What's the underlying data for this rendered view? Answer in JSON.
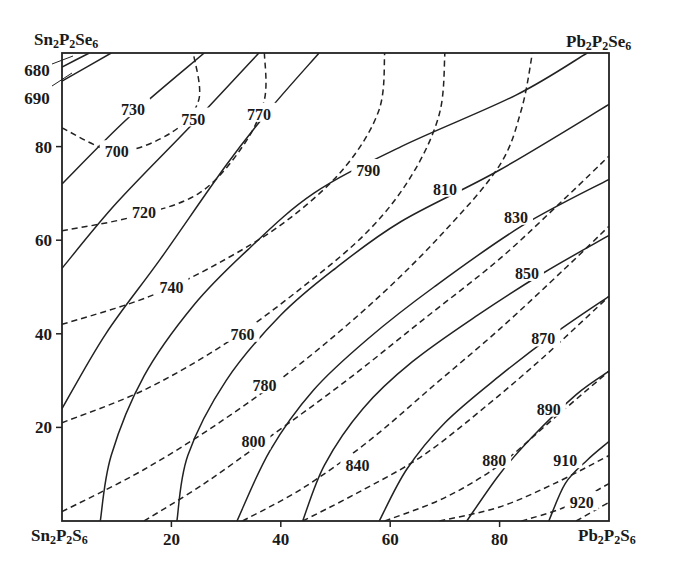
{
  "chart_data": {
    "type": "contour",
    "title": "",
    "corners": {
      "top_left": "Sn2P2Se6",
      "top_right": "Pb2P2Se6",
      "bottom_left": "Sn2P2S6",
      "bottom_right": "Pb2P2S6"
    },
    "corner_labels": {
      "top_left": {
        "base1": "Sn",
        "s1": "2",
        "base2": "P",
        "s2": "2",
        "base3": "Se",
        "s3": "6"
      },
      "top_right": {
        "base1": "Pb",
        "s1": "2",
        "base2": "P",
        "s2": "2",
        "base3": "Se",
        "s3": "6"
      },
      "bottom_left": {
        "base1": "Sn",
        "s1": "2",
        "base2": "P",
        "s2": "2",
        "base3": "S",
        "s3": "6"
      },
      "bottom_right": {
        "base1": "Pb",
        "s1": "2",
        "base2": "P",
        "s2": "2",
        "base3": "S",
        "s3": "6"
      }
    },
    "xlabel": "",
    "ylabel": "",
    "xlim": [
      0,
      100
    ],
    "ylim": [
      0,
      100
    ],
    "x_ticks": [
      "20",
      "40",
      "60",
      "80"
    ],
    "y_ticks": [
      "20",
      "40",
      "60",
      "80"
    ],
    "grid": false,
    "solid_isotherms": [
      {
        "value": 680,
        "label": "680",
        "points": [
          [
            0,
            97
          ],
          [
            5,
            100
          ]
        ]
      },
      {
        "value": 690,
        "label": "690",
        "points": [
          [
            0,
            94
          ],
          [
            9,
            100
          ]
        ]
      },
      {
        "value": 730,
        "label": "730",
        "points": [
          [
            0,
            72
          ],
          [
            12,
            86
          ],
          [
            26,
            100
          ]
        ]
      },
      {
        "value": 750,
        "label": "750",
        "points": [
          [
            0,
            54
          ],
          [
            10,
            68
          ],
          [
            24,
            85
          ],
          [
            36,
            100
          ]
        ]
      },
      {
        "value": 770,
        "label": "770",
        "points": [
          [
            0,
            24
          ],
          [
            8,
            40
          ],
          [
            18,
            56
          ],
          [
            30,
            76
          ],
          [
            38,
            88
          ],
          [
            47,
            100
          ]
        ]
      },
      {
        "value": 790,
        "label": "790",
        "points": [
          [
            7,
            0
          ],
          [
            9,
            14
          ],
          [
            15,
            31
          ],
          [
            24,
            46
          ],
          [
            34,
            58
          ],
          [
            46,
            70
          ],
          [
            62,
            80
          ],
          [
            83,
            91
          ],
          [
            96,
            100
          ]
        ]
      },
      {
        "value": 810,
        "label": "810",
        "points": [
          [
            21,
            0
          ],
          [
            23,
            14
          ],
          [
            30,
            30
          ],
          [
            40,
            44
          ],
          [
            50,
            54
          ],
          [
            62,
            64
          ],
          [
            80,
            75
          ],
          [
            100,
            89
          ]
        ]
      },
      {
        "value": 830,
        "label": "830",
        "points": [
          [
            32,
            0
          ],
          [
            38,
            15
          ],
          [
            46,
            28
          ],
          [
            56,
            39
          ],
          [
            68,
            50
          ],
          [
            84,
            63
          ],
          [
            100,
            73
          ]
        ]
      },
      {
        "value": 850,
        "label": "850",
        "points": [
          [
            44,
            0
          ],
          [
            48,
            12
          ],
          [
            55,
            24
          ],
          [
            64,
            34
          ],
          [
            76,
            44
          ],
          [
            88,
            53
          ],
          [
            100,
            61
          ]
        ]
      },
      {
        "value": 870,
        "label": "870",
        "points": [
          [
            58,
            0
          ],
          [
            63,
            11
          ],
          [
            70,
            21
          ],
          [
            80,
            31
          ],
          [
            90,
            40
          ],
          [
            100,
            48
          ]
        ]
      },
      {
        "value": 890,
        "label": "890",
        "points": [
          [
            74,
            0
          ],
          [
            80,
            10
          ],
          [
            86,
            18
          ],
          [
            94,
            27
          ],
          [
            100,
            32
          ]
        ]
      },
      {
        "value": 910,
        "label": "910",
        "points": [
          [
            89,
            0
          ],
          [
            92,
            8
          ],
          [
            96,
            13
          ],
          [
            100,
            17
          ]
        ]
      }
    ],
    "dashed_isotherms": [
      {
        "value": 700,
        "label": "700",
        "points": [
          [
            0,
            84
          ],
          [
            10,
            79
          ],
          [
            20,
            83
          ],
          [
            25,
            90
          ],
          [
            24,
            100
          ]
        ]
      },
      {
        "value": 720,
        "label": "720",
        "points": [
          [
            0,
            62
          ],
          [
            13,
            65
          ],
          [
            25,
            70
          ],
          [
            33,
            80
          ],
          [
            37,
            90
          ],
          [
            37,
            100
          ]
        ]
      },
      {
        "value": 740,
        "label": "740",
        "points": [
          [
            0,
            42
          ],
          [
            16,
            48
          ],
          [
            30,
            56
          ],
          [
            42,
            65
          ],
          [
            52,
            76
          ],
          [
            58,
            88
          ],
          [
            59,
            100
          ]
        ]
      },
      {
        "value": 760,
        "label": "760",
        "points": [
          [
            0,
            21
          ],
          [
            15,
            28
          ],
          [
            30,
            38
          ],
          [
            44,
            50
          ],
          [
            56,
            62
          ],
          [
            64,
            74
          ],
          [
            69,
            87
          ],
          [
            70,
            100
          ]
        ]
      },
      {
        "value": 780,
        "label": "780",
        "points": [
          [
            0,
            2
          ],
          [
            15,
            11
          ],
          [
            30,
            22
          ],
          [
            44,
            34
          ],
          [
            58,
            48
          ],
          [
            70,
            62
          ],
          [
            80,
            76
          ],
          [
            84,
            88
          ],
          [
            86,
            100
          ]
        ]
      },
      {
        "value": 800,
        "label": "800",
        "points": [
          [
            15,
            0
          ],
          [
            26,
            8
          ],
          [
            38,
            18
          ],
          [
            52,
            30
          ],
          [
            66,
            43
          ],
          [
            80,
            56
          ],
          [
            92,
            69
          ],
          [
            100,
            78
          ]
        ]
      },
      {
        "value": 820,
        "label": "",
        "points": [
          [
            33,
            0
          ],
          [
            44,
            7
          ],
          [
            56,
            17
          ],
          [
            68,
            29
          ],
          [
            80,
            41
          ],
          [
            92,
            54
          ],
          [
            100,
            63
          ]
        ]
      },
      {
        "value": 840,
        "label": "840",
        "points": [
          [
            44,
            0
          ],
          [
            54,
            6
          ],
          [
            66,
            14
          ],
          [
            78,
            25
          ],
          [
            88,
            35
          ],
          [
            100,
            48
          ]
        ]
      },
      {
        "value": 860,
        "label": "",
        "points": [
          [
            59,
            0
          ],
          [
            70,
            5
          ],
          [
            80,
            12
          ],
          [
            90,
            22
          ],
          [
            100,
            32
          ]
        ]
      },
      {
        "value": 880,
        "label": "880",
        "points": [
          [
            69,
            0
          ],
          [
            80,
            3
          ],
          [
            90,
            8
          ],
          [
            100,
            14
          ]
        ]
      },
      {
        "value": 900,
        "label": "",
        "points": [
          [
            84,
            0
          ],
          [
            92,
            3
          ],
          [
            100,
            8
          ]
        ]
      },
      {
        "value": 920,
        "label": "920",
        "points": [
          [
            94,
            0
          ],
          [
            100,
            4
          ]
        ]
      }
    ],
    "label_positions": {
      "680": [
        3,
        100
      ],
      "690": [
        3,
        94
      ],
      "700": [
        10,
        79
      ],
      "720": [
        15,
        66
      ],
      "730": [
        13,
        88
      ],
      "740": [
        20,
        50
      ],
      "750": [
        24,
        86
      ],
      "760": [
        33,
        40
      ],
      "770": [
        36,
        87
      ],
      "780": [
        37,
        29
      ],
      "790": [
        56,
        75
      ],
      "800": [
        35,
        17
      ],
      "810": [
        70,
        71
      ],
      "830": [
        83,
        65
      ],
      "840": [
        54,
        12
      ],
      "850": [
        85,
        53
      ],
      "870": [
        88,
        39
      ],
      "880": [
        79,
        13
      ],
      "890": [
        89,
        24
      ],
      "910": [
        92,
        13
      ],
      "920": [
        95,
        4
      ]
    }
  }
}
